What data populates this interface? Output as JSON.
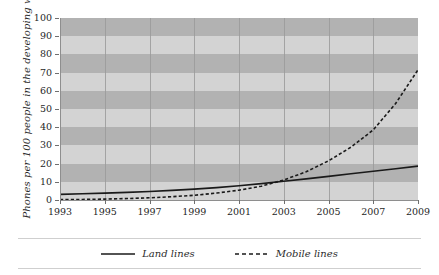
{
  "chart_data": {
    "type": "line",
    "title": "",
    "xlabel": "",
    "ylabel": "Phones per 100 people in the developing world",
    "xlim": [
      1993,
      2009
    ],
    "ylim": [
      0,
      100
    ],
    "grid": true,
    "legend_position": "bottom",
    "x": [
      1993,
      1994,
      1995,
      1996,
      1997,
      1998,
      1999,
      2000,
      2001,
      2002,
      2003,
      2004,
      2005,
      2006,
      2007,
      2008,
      2009
    ],
    "xticks": [
      1993,
      1995,
      1997,
      1999,
      2001,
      2003,
      2005,
      2007,
      2009
    ],
    "xtick_labels": [
      "1993",
      "1995",
      "1997",
      "1999",
      "2001",
      "2003",
      "2005",
      "2007",
      "2009"
    ],
    "yticks": [
      0,
      10,
      20,
      30,
      40,
      50,
      60,
      70,
      80,
      90,
      100
    ],
    "ytick_labels": [
      "0",
      "10",
      "20",
      "30",
      "40",
      "50",
      "60",
      "70",
      "80",
      "90",
      "100"
    ],
    "series": [
      {
        "name": "Land lines",
        "style": "solid",
        "color": "#1a1a1a",
        "values": [
          3.1,
          3.4,
          3.8,
          4.2,
          4.7,
          5.3,
          6.0,
          6.8,
          7.8,
          9.0,
          10.3,
          11.6,
          13.0,
          14.4,
          15.8,
          17.2,
          18.6
        ]
      },
      {
        "name": "Mobile lines",
        "style": "dashed",
        "color": "#1a1a1a",
        "values": [
          0.2,
          0.3,
          0.5,
          0.8,
          1.2,
          1.8,
          2.6,
          3.8,
          5.4,
          7.6,
          11.0,
          15.5,
          21.5,
          29.0,
          38.5,
          53.0,
          71.5
        ]
      }
    ]
  },
  "legend": {
    "items": [
      {
        "label": "Land lines",
        "style": "solid"
      },
      {
        "label": "Mobile lines",
        "style": "dashed"
      }
    ]
  },
  "colors": {
    "band_dark": "#b2b2b2",
    "band_light": "#d3d3d3",
    "gridline": "#9a9a9a",
    "axis": "#8e8e8e",
    "line": "#1a1a1a",
    "text": "#1f1f1f",
    "separator": "#cfcfcf"
  }
}
